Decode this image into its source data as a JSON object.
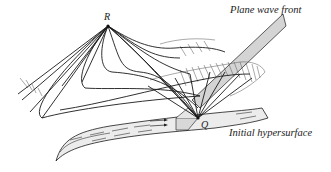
{
  "diagram": {
    "labels": {
      "point_r": "R",
      "point_q": "Q",
      "plane_wave_front": "Plane wave front",
      "initial_hypersurface": "Initial hypersurface"
    },
    "colors": {
      "line": "#1a1a1a",
      "hatch": "#555555",
      "surface_fill": "#ececec",
      "wavefront_fill": "#d4d4d4",
      "background": "#ffffff"
    }
  }
}
